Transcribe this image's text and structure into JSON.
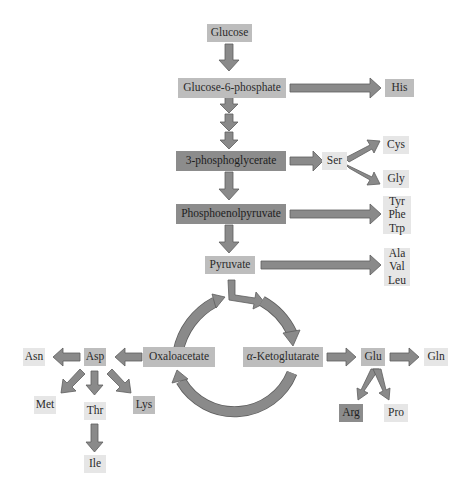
{
  "colors": {
    "arrow_fill": "#8a8a8a",
    "arrow_stroke": "#5a5a5a",
    "box_dark": "#8c8c8c",
    "box_mid": "#bdbdbd",
    "box_light": "#e6e6e6"
  },
  "nodes": {
    "glucose": "Glucose",
    "g6p": "Glucose-6-phosphate",
    "his": "His",
    "pg3": "3-phosphoglycerate",
    "ser": "Ser",
    "cys": "Cys",
    "gly": "Gly",
    "pep": "Phosphoenolpyruvate",
    "aromatic": [
      "Tyr",
      "Phe",
      "Trp"
    ],
    "pyruvate": "Pyruvate",
    "branched": [
      "Ala",
      "Val",
      "Leu"
    ],
    "oxaloacetate": "Oxaloacetate",
    "akg_prefix": "α",
    "akg_rest": "-Ketoglutarate",
    "asp": "Asp",
    "asn": "Asn",
    "met": "Met",
    "thr": "Thr",
    "lys": "Lys",
    "ile": "Ile",
    "glu": "Glu",
    "gln": "Gln",
    "arg": "Arg",
    "pro": "Pro"
  },
  "edges": [
    {
      "from": "Glucose",
      "to": "Glucose-6-phosphate"
    },
    {
      "from": "Glucose-6-phosphate",
      "to": "His"
    },
    {
      "from": "Glucose-6-phosphate",
      "to": "3-phosphoglycerate",
      "steps": 3
    },
    {
      "from": "3-phosphoglycerate",
      "to": "Ser"
    },
    {
      "from": "Ser",
      "to": "Cys"
    },
    {
      "from": "Ser",
      "to": "Gly"
    },
    {
      "from": "3-phosphoglycerate",
      "to": "Phosphoenolpyruvate"
    },
    {
      "from": "Phosphoenolpyruvate",
      "to": "Tyr/Phe/Trp"
    },
    {
      "from": "Phosphoenolpyruvate",
      "to": "Pyruvate"
    },
    {
      "from": "Pyruvate",
      "to": "Ala/Val/Leu"
    },
    {
      "from": "Pyruvate",
      "to": "α-Ketoglutarate",
      "via": "TCA cycle"
    },
    {
      "from": "Oxaloacetate",
      "to": "Pyruvate-entry",
      "via": "TCA cycle"
    },
    {
      "from": "α-Ketoglutarate",
      "to": "Oxaloacetate",
      "via": "TCA cycle"
    },
    {
      "from": "Oxaloacetate",
      "to": "Asp"
    },
    {
      "from": "Asp",
      "to": "Asn"
    },
    {
      "from": "Asp",
      "to": "Met"
    },
    {
      "from": "Asp",
      "to": "Thr"
    },
    {
      "from": "Asp",
      "to": "Lys"
    },
    {
      "from": "Thr",
      "to": "Ile"
    },
    {
      "from": "α-Ketoglutarate",
      "to": "Glu"
    },
    {
      "from": "Glu",
      "to": "Gln"
    },
    {
      "from": "Glu",
      "to": "Arg"
    },
    {
      "from": "Glu",
      "to": "Pro"
    }
  ]
}
